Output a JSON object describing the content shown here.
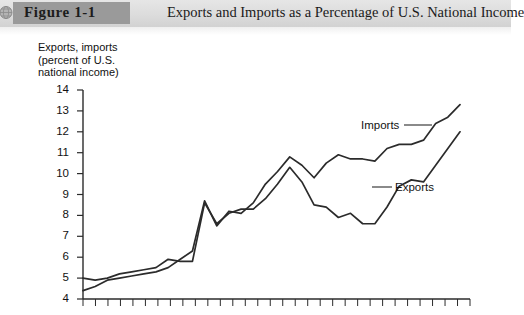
{
  "header": {
    "icon": "globe-icon",
    "figure_label": "Figure 1-1",
    "title": "Exports and Imports as a Percentage of U.S. National Income",
    "band_color": "#dcdcdc",
    "tag_color": "#9a9a9a"
  },
  "chart_data": {
    "type": "line",
    "title": "Exports and Imports as a Percentage of U.S. National Income",
    "xlabel": "",
    "ylabel": "Exports, imports\n(percent of U.S.\nnational income)",
    "ylim": [
      4,
      14
    ],
    "yticks": [
      4,
      5,
      6,
      7,
      8,
      9,
      10,
      11,
      12,
      13,
      14
    ],
    "ytick_labels": [
      "4",
      "5",
      "6",
      "7",
      "8",
      "9",
      "10",
      "11",
      "12",
      "13",
      "14"
    ],
    "xlim": [
      0,
      32
    ],
    "xtick_count": 32,
    "xtick_labels": [],
    "grid": false,
    "legend": "inline-annotations",
    "line_color": "#2b2b2b",
    "series": [
      {
        "name": "Imports",
        "label_position": "upper-right",
        "values": [
          4.4,
          4.6,
          4.9,
          5.0,
          5.1,
          5.2,
          5.3,
          5.5,
          5.9,
          6.3,
          8.7,
          7.5,
          8.2,
          8.1,
          8.6,
          9.5,
          10.1,
          10.8,
          10.4,
          9.8,
          10.5,
          10.9,
          10.7,
          10.7,
          10.6,
          11.2,
          11.4,
          11.4,
          11.6,
          12.4,
          12.7,
          13.3
        ]
      },
      {
        "name": "Exports",
        "label_position": "center-right",
        "values": [
          5.0,
          4.9,
          5.0,
          5.2,
          5.3,
          5.4,
          5.5,
          5.9,
          5.8,
          5.8,
          8.6,
          7.6,
          8.1,
          8.3,
          8.3,
          8.8,
          9.5,
          10.3,
          9.6,
          8.5,
          8.4,
          7.9,
          8.1,
          7.6,
          7.6,
          8.4,
          9.4,
          9.7,
          9.6,
          10.4,
          11.2,
          12.0
        ]
      }
    ],
    "annotations": [
      {
        "text": "Imports",
        "leader": true
      },
      {
        "text": "Exports",
        "leader": true
      }
    ]
  }
}
